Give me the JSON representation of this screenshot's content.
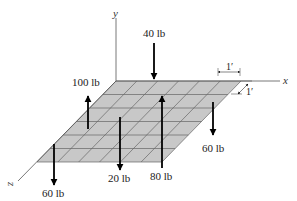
{
  "diagram": {
    "type": "3d-force-system-on-plate",
    "axes": {
      "x": "x",
      "y": "y",
      "z": "z"
    },
    "grid": {
      "columns": 6,
      "rows": 6,
      "cell_size_label": "1′",
      "fill_color": "#c8c8c8",
      "line_color": "#666666"
    },
    "dimensions": [
      {
        "label": "1′",
        "direction": "x"
      },
      {
        "label": "1′",
        "direction": "z"
      }
    ],
    "forces": [
      {
        "label": "40 lb",
        "magnitude": 40,
        "direction": "down",
        "x": 2,
        "z": 0
      },
      {
        "label": "100 lb",
        "magnitude": 100,
        "direction": "up",
        "x": 0,
        "z": 2
      },
      {
        "label": "80 lb",
        "magnitude": 80,
        "direction": "up",
        "x": 3,
        "z": 1
      },
      {
        "label": "60 lb",
        "magnitude": 60,
        "direction": "down",
        "x": 5,
        "z": 1
      },
      {
        "label": "20 lb",
        "magnitude": 20,
        "direction": "down",
        "x": 1,
        "z": 3
      },
      {
        "label": "60 lb",
        "magnitude": 60,
        "direction": "down",
        "x": 0,
        "z": 5
      }
    ]
  }
}
